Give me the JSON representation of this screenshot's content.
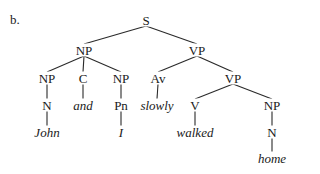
{
  "figure_label": "b.",
  "tree": {
    "nodes": [
      {
        "id": "S",
        "label": "S",
        "x": 146,
        "y": 20,
        "type": "category"
      },
      {
        "id": "NP1",
        "label": "NP",
        "x": 84,
        "y": 50,
        "type": "category"
      },
      {
        "id": "VP1",
        "label": "VP",
        "x": 197,
        "y": 50,
        "type": "category"
      },
      {
        "id": "NP2",
        "label": "NP",
        "x": 47,
        "y": 78,
        "type": "category"
      },
      {
        "id": "C",
        "label": "C",
        "x": 83,
        "y": 78,
        "type": "category"
      },
      {
        "id": "NP3",
        "label": "NP",
        "x": 121,
        "y": 78,
        "type": "category"
      },
      {
        "id": "Av",
        "label": "Av",
        "x": 158,
        "y": 78,
        "type": "category"
      },
      {
        "id": "VP2",
        "label": "VP",
        "x": 233,
        "y": 78,
        "type": "category"
      },
      {
        "id": "N1",
        "label": "N",
        "x": 47,
        "y": 105,
        "type": "category"
      },
      {
        "id": "and",
        "label": "and",
        "x": 83,
        "y": 105,
        "type": "word"
      },
      {
        "id": "Pn",
        "label": "Pn",
        "x": 121,
        "y": 105,
        "type": "category"
      },
      {
        "id": "slowly",
        "label": "slowly",
        "x": 157,
        "y": 105,
        "type": "word"
      },
      {
        "id": "V",
        "label": "V",
        "x": 195,
        "y": 105,
        "type": "category"
      },
      {
        "id": "NP4",
        "label": "NP",
        "x": 272,
        "y": 105,
        "type": "category"
      },
      {
        "id": "John",
        "label": "John",
        "x": 47,
        "y": 132,
        "type": "word"
      },
      {
        "id": "I",
        "label": "I",
        "x": 121,
        "y": 132,
        "type": "word"
      },
      {
        "id": "walked",
        "label": "walked",
        "x": 195,
        "y": 132,
        "type": "word"
      },
      {
        "id": "N2",
        "label": "N",
        "x": 272,
        "y": 132,
        "type": "category"
      },
      {
        "id": "home",
        "label": "home",
        "x": 272,
        "y": 158,
        "type": "word"
      }
    ],
    "edges": [
      [
        "S",
        "NP1"
      ],
      [
        "S",
        "VP1"
      ],
      [
        "NP1",
        "NP2"
      ],
      [
        "NP1",
        "C"
      ],
      [
        "NP1",
        "NP3"
      ],
      [
        "VP1",
        "Av"
      ],
      [
        "VP1",
        "VP2"
      ],
      [
        "NP2",
        "N1"
      ],
      [
        "C",
        "and"
      ],
      [
        "NP3",
        "Pn"
      ],
      [
        "Av",
        "slowly"
      ],
      [
        "VP2",
        "V"
      ],
      [
        "VP2",
        "NP4"
      ],
      [
        "N1",
        "John"
      ],
      [
        "Pn",
        "I"
      ],
      [
        "V",
        "walked"
      ],
      [
        "NP4",
        "N2"
      ],
      [
        "N2",
        "home"
      ]
    ]
  }
}
